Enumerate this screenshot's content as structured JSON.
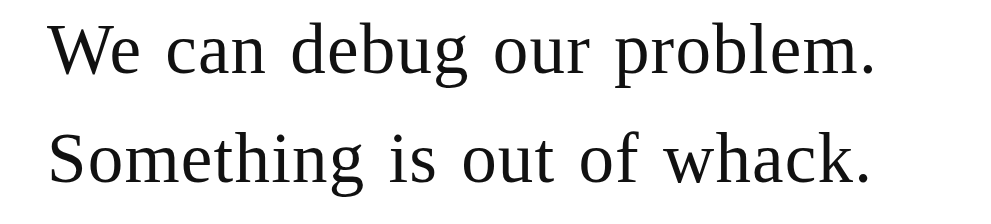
{
  "document": {
    "lines": [
      "We can debug our problem.",
      "Something is out of whack."
    ]
  }
}
